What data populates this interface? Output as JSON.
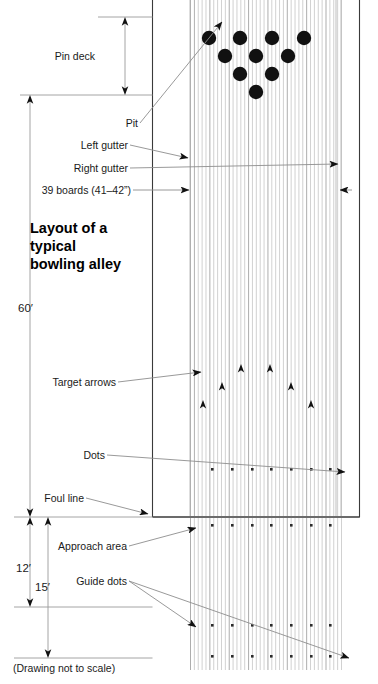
{
  "figure": {
    "title_lines": [
      "Layout of a",
      "typical",
      "bowling alley"
    ],
    "note": "(Drawing not to scale)"
  },
  "labels": {
    "pin_deck": "Pin deck",
    "pit": "Pit",
    "left_gutter": "Left gutter",
    "right_gutter": "Right gutter",
    "boards": "39 boards (41–42”)",
    "target_arrows": "Target arrows",
    "dots": "Dots",
    "foul_line": "Foul line",
    "approach_area": "Approach area",
    "guide_dots": "Guide dots"
  },
  "dimensions": {
    "lane_length": "60′",
    "approach_12": "12′",
    "approach_15": "15′"
  },
  "colors": {
    "ink": "#111111",
    "leader": "#8d8d8d",
    "board": "#c9c9c9",
    "board_dark": "#9e9e9e",
    "box": "#3a3a3a",
    "background": "#ffffff"
  },
  "chart_data": {
    "type": "diagram",
    "board_count": 39,
    "board_width_in": "41–42",
    "lane_length_ft": 60,
    "approach_depths_ft": [
      12,
      15
    ],
    "pin_count": 10,
    "pin_rows": [
      4,
      3,
      2,
      1
    ],
    "target_arrow_count": 7,
    "dot_row_counts": [
      7,
      7,
      7,
      7
    ],
    "regions": [
      "Pin deck",
      "Pit",
      "Left gutter",
      "Right gutter",
      "Lane (39 boards)",
      "Target arrows",
      "Dots",
      "Foul line",
      "Approach area",
      "Guide dots"
    ]
  }
}
